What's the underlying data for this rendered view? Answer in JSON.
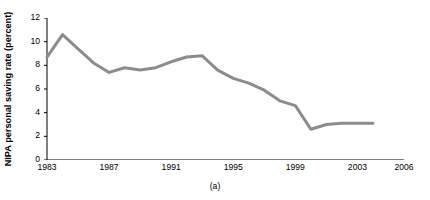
{
  "chart_data": {
    "type": "line",
    "title": "",
    "caption": "(a)",
    "xlabel": "",
    "ylabel": "NIPA personal saving rate (percent)",
    "x": [
      1983,
      1984,
      1985,
      1986,
      1987,
      1988,
      1989,
      1990,
      1991,
      1992,
      1993,
      1994,
      1995,
      1996,
      1997,
      1998,
      1999,
      2000,
      2001,
      2002,
      2003,
      2004
    ],
    "values": [
      8.7,
      10.6,
      9.4,
      8.2,
      7.4,
      7.8,
      7.6,
      7.8,
      8.3,
      8.7,
      8.8,
      7.6,
      6.9,
      6.5,
      5.9,
      5.0,
      4.6,
      2.6,
      3.0,
      3.1,
      3.1,
      3.1
    ],
    "series": [
      {
        "name": "NIPA personal saving rate",
        "values": [
          8.7,
          10.6,
          9.4,
          8.2,
          7.4,
          7.8,
          7.6,
          7.8,
          8.3,
          8.7,
          8.8,
          7.6,
          6.9,
          6.5,
          5.9,
          5.0,
          4.6,
          2.6,
          3.0,
          3.1,
          3.1,
          3.1
        ]
      }
    ],
    "xlim": [
      1983,
      2006
    ],
    "ylim": [
      0,
      12
    ],
    "yticks": [
      0,
      2,
      4,
      6,
      8,
      10,
      12
    ],
    "ytick_labels": [
      "0",
      "2",
      "4",
      "6",
      "8",
      "10",
      "12"
    ],
    "xticks": [
      1983,
      1984,
      1985,
      1986,
      1987,
      1988,
      1989,
      1990,
      1991,
      1992,
      1993,
      1994,
      1995,
      1996,
      1997,
      1998,
      1999,
      2000,
      2001,
      2002,
      2003,
      2004,
      2005,
      2006
    ],
    "xtick_labels_shown": [
      {
        "value": 1983,
        "label": "1983"
      },
      {
        "value": 1987,
        "label": "1987"
      },
      {
        "value": 1991,
        "label": "1991"
      },
      {
        "value": 1995,
        "label": "1995"
      },
      {
        "value": 1999,
        "label": "1999"
      },
      {
        "value": 2003,
        "label": "2003"
      },
      {
        "value": 2006,
        "label": "2006"
      }
    ],
    "grid": false,
    "legend": "none",
    "line_color": "#8c8c8c",
    "line_width": 3,
    "axis_color": "#000000"
  }
}
